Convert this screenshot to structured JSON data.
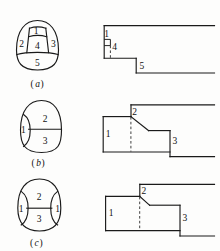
{
  "figure": {
    "title": "",
    "background_color": "#fdfdfc",
    "ink_color": "#1a1a1a",
    "panels": [
      {
        "id": "a",
        "label": "(a)",
        "label_text": "a",
        "left_shape": {
          "name": "rounded-blob-5-regions",
          "region_labels": [
            "1",
            "2",
            "3",
            "4",
            "5"
          ]
        },
        "right_profile": {
          "name": "step-profile-a",
          "region_labels": [
            "1",
            "4",
            "5"
          ]
        }
      },
      {
        "id": "b",
        "label": "(b)",
        "label_text": "b",
        "left_shape": {
          "name": "rounded-blob-3-regions",
          "region_labels": [
            "1",
            "2",
            "3"
          ]
        },
        "right_profile": {
          "name": "step-profile-b",
          "region_labels": [
            "1",
            "2",
            "3"
          ]
        }
      },
      {
        "id": "c",
        "label": "(c)",
        "label_text": "c",
        "left_shape": {
          "name": "circle-blob-4-regions",
          "region_labels": [
            "1",
            "2",
            "3",
            "1"
          ]
        },
        "right_profile": {
          "name": "step-profile-c",
          "region_labels": [
            "1",
            "2",
            "3"
          ]
        }
      }
    ],
    "labels": {
      "a_n1": "1",
      "a_n2": "2",
      "a_n3": "3",
      "a_n4": "4",
      "a_n5": "5",
      "a_panel_open": "(",
      "a_panel_letter": "a",
      "a_panel_close": ")",
      "a_r1": "1",
      "a_r4": "4",
      "a_r5": "5",
      "b_n1": "1",
      "b_n2": "2",
      "b_n3": "3",
      "b_panel_open": "(",
      "b_panel_letter": "b",
      "b_panel_close": ")",
      "b_r1": "1",
      "b_r2": "2",
      "b_r3": "3",
      "c_n1L": "1",
      "c_n1R": "1",
      "c_n2": "2",
      "c_n3": "3",
      "c_panel_open": "(",
      "c_panel_letter": "c",
      "c_panel_close": ")",
      "c_r1": "1",
      "c_r2": "2",
      "c_r3": "3"
    }
  }
}
